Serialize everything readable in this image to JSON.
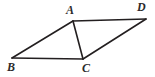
{
  "figure": {
    "name": "parallelogram-with-diagonal",
    "background_color": "#ffffff",
    "stroke_color": "#231f20",
    "label_color": "#2b2b2b",
    "stroke_width": 1.6,
    "width": 155,
    "height": 77,
    "vertices": [
      {
        "id": "A",
        "label": "A",
        "x": 73,
        "y": 21,
        "label_x": 66,
        "label_y": 4
      },
      {
        "id": "D",
        "label": "D",
        "x": 146,
        "y": 19,
        "label_x": 137,
        "label_y": 1
      },
      {
        "id": "B",
        "label": "B",
        "x": 12,
        "y": 58,
        "label_x": 7,
        "label_y": 61
      },
      {
        "id": "C",
        "label": "C",
        "x": 83,
        "y": 59,
        "label_x": 82,
        "label_y": 62
      }
    ],
    "segments": [
      {
        "id": "AB",
        "from": "A",
        "to": "B"
      },
      {
        "id": "BC",
        "from": "B",
        "to": "C"
      },
      {
        "id": "AC",
        "from": "A",
        "to": "C"
      },
      {
        "id": "AD",
        "from": "A",
        "to": "D"
      },
      {
        "id": "CD",
        "from": "C",
        "to": "D"
      }
    ]
  }
}
